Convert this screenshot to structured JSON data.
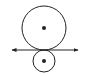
{
  "diagram": {
    "stroke_color": "#222222",
    "background": "#ffffff",
    "large_circle": {
      "cx": 44,
      "cy": 28,
      "r": 22,
      "center_dot_r": 2
    },
    "small_circle": {
      "cx": 44,
      "cy": 61,
      "r": 11,
      "center_dot_r": 2
    },
    "tangent_line": {
      "x1": 12,
      "x2": 78,
      "y": 50,
      "arrows": "both"
    }
  }
}
